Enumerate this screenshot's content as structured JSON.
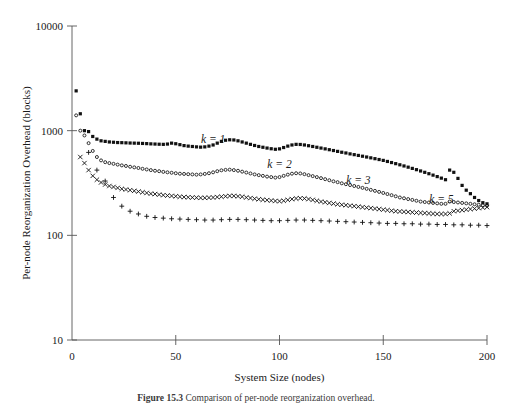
{
  "figure": {
    "caption_number": "Figure 15.3",
    "caption_text": "Comparison of per-node reorganization overhead."
  },
  "chart_data": {
    "type": "scatter",
    "title": "",
    "xlabel": "System Size (nodes)",
    "ylabel": "Per-node Reorganization Overhead (blocks)",
    "xlim": [
      0,
      200
    ],
    "ylim": [
      10,
      10000
    ],
    "yscale": "log",
    "xscale": "linear",
    "grid": false,
    "legend_position": "inline-annotations",
    "xticks": [
      0,
      50,
      100,
      150,
      200
    ],
    "xtick_labels": [
      "0",
      "50",
      "100",
      "150",
      "200"
    ],
    "yticks": [
      10,
      100,
      1000,
      10000
    ],
    "ytick_labels": [
      "10",
      "100",
      "1000",
      "10000"
    ],
    "series": [
      {
        "name": "k = 1",
        "label": "k = 1",
        "marker": "filled-square",
        "label_x": 68,
        "label_y": 760,
        "x": [
          2,
          4,
          6,
          8,
          10,
          12,
          14,
          16,
          18,
          20,
          22,
          24,
          26,
          28,
          30,
          32,
          34,
          36,
          38,
          40,
          42,
          44,
          46,
          48,
          50,
          52,
          54,
          56,
          58,
          60,
          62,
          64,
          66,
          68,
          70,
          72,
          74,
          76,
          78,
          80,
          82,
          84,
          86,
          88,
          90,
          92,
          94,
          96,
          98,
          100,
          102,
          104,
          106,
          108,
          110,
          112,
          114,
          116,
          118,
          120,
          122,
          124,
          126,
          128,
          130,
          132,
          134,
          136,
          138,
          140,
          142,
          144,
          146,
          148,
          150,
          152,
          154,
          156,
          158,
          160,
          162,
          164,
          166,
          168,
          170,
          172,
          174,
          176,
          178,
          180,
          182,
          184,
          186,
          188,
          190,
          192,
          194,
          196,
          198,
          200
        ],
        "y": [
          2400,
          1450,
          1000,
          980,
          880,
          830,
          800,
          790,
          780,
          775,
          770,
          768,
          765,
          762,
          760,
          758,
          755,
          752,
          748,
          745,
          742,
          740,
          745,
          760,
          750,
          735,
          720,
          712,
          706,
          700,
          696,
          700,
          712,
          730,
          760,
          790,
          810,
          818,
          815,
          800,
          780,
          760,
          740,
          722,
          706,
          694,
          682,
          672,
          664,
          670,
          690,
          712,
          730,
          740,
          738,
          730,
          718,
          706,
          694,
          682,
          670,
          658,
          646,
          634,
          622,
          612,
          600,
          590,
          580,
          570,
          560,
          550,
          540,
          530,
          520,
          508,
          496,
          484,
          472,
          460,
          448,
          436,
          424,
          412,
          400,
          388,
          376,
          364,
          352,
          340,
          420,
          400,
          350,
          300,
          270,
          250,
          230,
          215,
          205,
          200
        ]
      },
      {
        "name": "k = 2",
        "label": "k = 2",
        "marker": "open-circle",
        "label_x": 100,
        "label_y": 440,
        "x": [
          2,
          4,
          6,
          8,
          10,
          12,
          14,
          16,
          18,
          20,
          22,
          24,
          26,
          28,
          30,
          32,
          34,
          36,
          38,
          40,
          42,
          44,
          46,
          48,
          50,
          52,
          54,
          56,
          58,
          60,
          62,
          64,
          66,
          68,
          70,
          72,
          74,
          76,
          78,
          80,
          82,
          84,
          86,
          88,
          90,
          92,
          94,
          96,
          98,
          100,
          102,
          104,
          106,
          108,
          110,
          112,
          114,
          116,
          118,
          120,
          122,
          124,
          126,
          128,
          130,
          132,
          134,
          136,
          138,
          140,
          142,
          144,
          146,
          148,
          150,
          152,
          154,
          156,
          158,
          160,
          162,
          164,
          166,
          168,
          170,
          172,
          174,
          176,
          178,
          180,
          182,
          184,
          186,
          188,
          190,
          192,
          194,
          196,
          198,
          200
        ],
        "y": [
          1400,
          1000,
          900,
          760,
          640,
          560,
          520,
          500,
          490,
          482,
          474,
          466,
          460,
          452,
          446,
          440,
          432,
          426,
          420,
          414,
          410,
          404,
          400,
          396,
          392,
          388,
          386,
          384,
          382,
          380,
          382,
          386,
          392,
          400,
          410,
          418,
          422,
          424,
          420,
          414,
          406,
          398,
          390,
          382,
          376,
          370,
          364,
          360,
          356,
          360,
          370,
          380,
          388,
          392,
          390,
          384,
          376,
          368,
          360,
          352,
          344,
          336,
          328,
          322,
          314,
          308,
          302,
          296,
          290,
          284,
          278,
          272,
          266,
          260,
          254,
          248,
          242,
          236,
          230,
          226,
          222,
          218,
          214,
          210,
          208,
          206,
          204,
          202,
          200,
          200,
          210,
          208,
          206,
          204,
          202,
          200,
          198,
          196,
          194,
          192
        ]
      },
      {
        "name": "k = 3",
        "label": "k = 3",
        "marker": "x-cross",
        "label_x": 138,
        "label_y": 310,
        "x": [
          4,
          6,
          8,
          10,
          12,
          14,
          16,
          18,
          20,
          22,
          24,
          26,
          28,
          30,
          32,
          34,
          36,
          38,
          40,
          42,
          44,
          46,
          48,
          50,
          52,
          54,
          56,
          58,
          60,
          62,
          64,
          66,
          68,
          70,
          72,
          74,
          76,
          78,
          80,
          82,
          84,
          86,
          88,
          90,
          92,
          94,
          96,
          98,
          100,
          102,
          104,
          106,
          108,
          110,
          112,
          114,
          116,
          118,
          120,
          122,
          124,
          126,
          128,
          130,
          132,
          134,
          136,
          138,
          140,
          142,
          144,
          146,
          148,
          150,
          152,
          154,
          156,
          158,
          160,
          162,
          164,
          166,
          168,
          170,
          172,
          174,
          176,
          178,
          180,
          182,
          184,
          186,
          188,
          190,
          192,
          194,
          196,
          198,
          200
        ],
        "y": [
          560,
          490,
          420,
          370,
          340,
          320,
          306,
          296,
          290,
          284,
          278,
          274,
          270,
          266,
          262,
          258,
          254,
          250,
          248,
          245,
          242,
          240,
          238,
          236,
          234,
          232,
          231,
          230,
          229,
          228,
          228,
          229,
          230,
          232,
          234,
          236,
          238,
          238,
          236,
          234,
          230,
          227,
          224,
          221,
          219,
          217,
          215,
          213,
          212,
          214,
          218,
          222,
          225,
          226,
          225,
          222,
          218,
          214,
          210,
          207,
          204,
          201,
          198,
          196,
          194,
          192,
          190,
          188,
          186,
          184,
          182,
          180,
          178,
          176,
          174,
          172,
          170,
          169,
          168,
          167,
          166,
          165,
          164,
          163,
          162,
          161,
          160,
          160,
          160,
          162,
          170,
          172,
          174,
          176,
          178,
          180,
          182,
          184,
          186
        ]
      },
      {
        "name": "k = 5",
        "label": "k = 5",
        "marker": "plus",
        "label_x": 178,
        "label_y": 205,
        "x": [
          8,
          12,
          16,
          20,
          24,
          28,
          32,
          36,
          40,
          44,
          48,
          52,
          56,
          60,
          64,
          68,
          72,
          76,
          80,
          84,
          88,
          92,
          96,
          100,
          104,
          108,
          112,
          116,
          120,
          124,
          128,
          132,
          136,
          140,
          144,
          148,
          152,
          156,
          160,
          164,
          168,
          172,
          176,
          180,
          184,
          188,
          192,
          196,
          200
        ],
        "y": [
          620,
          420,
          330,
          230,
          190,
          170,
          160,
          152,
          148,
          146,
          144,
          143,
          142,
          141,
          140,
          140,
          141,
          142,
          142,
          141,
          140,
          139,
          138,
          138,
          139,
          140,
          140,
          139,
          138,
          137,
          136,
          135,
          134,
          133,
          132,
          131,
          130,
          130,
          129,
          129,
          128,
          128,
          127,
          127,
          126,
          126,
          125,
          125,
          124
        ]
      }
    ]
  }
}
